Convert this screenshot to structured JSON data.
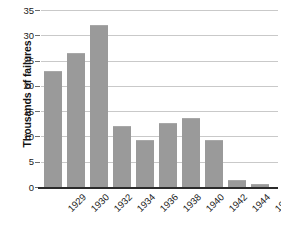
{
  "chart_data": {
    "type": "bar",
    "title": "",
    "subtitle": "",
    "xlabel": "",
    "ylabel": "Thousands of failures",
    "categories": [
      "1929",
      "1930",
      "1932",
      "1934",
      "1936",
      "1938",
      "1940",
      "1942",
      "1944",
      "1945"
    ],
    "values": [
      23,
      26.5,
      32,
      12,
      9.3,
      12.7,
      13.7,
      9.3,
      1.4,
      0.6
    ],
    "series": [
      {
        "name": "Business failures",
        "values": [
          23,
          26.5,
          32,
          12,
          9.3,
          12.7,
          13.7,
          9.3,
          1.4,
          0.6
        ]
      }
    ],
    "ylim": [
      0,
      35
    ],
    "yticks": [
      0,
      5,
      10,
      15,
      20,
      25,
      30,
      35
    ],
    "ytick_labels": [
      "0",
      "5",
      "10",
      "15",
      "20",
      "25",
      "30",
      "35"
    ],
    "grid": true,
    "legend": false,
    "legend_position": "none",
    "bar_color": "#9a9a9a",
    "gridline_color": "#c9c9c9",
    "axis_color": "#2b2b2b",
    "background_color": "#ffffff",
    "annotations": []
  }
}
